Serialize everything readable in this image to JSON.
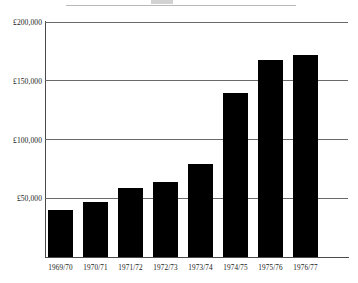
{
  "chart_data": {
    "type": "bar",
    "title": "",
    "xlabel": "",
    "ylabel": "",
    "categories": [
      "1969/70",
      "1970/71",
      "1971/72",
      "1972/73",
      "1973/74",
      "1974/75",
      "1975/76",
      "1976/77"
    ],
    "values": [
      40000,
      47000,
      59000,
      64000,
      79000,
      140000,
      168000,
      172000
    ],
    "ylim": [
      0,
      200000
    ],
    "yticks": [
      50000,
      100000,
      150000,
      200000
    ],
    "ytick_labels": [
      "£50,000",
      "£100,000",
      "£150,000",
      "£200,000"
    ],
    "grid": true,
    "legend": null,
    "bar_color": "#000000",
    "currency": "£"
  },
  "axes": {
    "y": {
      "ticks": [
        {
          "label": "£200,000",
          "value": 200000
        },
        {
          "label": "£150,000",
          "value": 150000
        },
        {
          "label": "£100,000",
          "value": 100000
        },
        {
          "label": "£50,000",
          "value": 50000
        }
      ]
    },
    "x": {
      "ticks": [
        {
          "label": "1969/70"
        },
        {
          "label": "1970/71"
        },
        {
          "label": "1971/72"
        },
        {
          "label": "1972/73"
        },
        {
          "label": "1973/74"
        },
        {
          "label": "1974/75"
        },
        {
          "label": "1975/76"
        },
        {
          "label": "1976/77"
        }
      ]
    }
  },
  "bars": [
    {
      "category": "1969/70",
      "value": 40000
    },
    {
      "category": "1970/71",
      "value": 47000
    },
    {
      "category": "1971/72",
      "value": 59000
    },
    {
      "category": "1972/73",
      "value": 64000
    },
    {
      "category": "1973/74",
      "value": 79000
    },
    {
      "category": "1974/75",
      "value": 140000
    },
    {
      "category": "1975/76",
      "value": 168000
    },
    {
      "category": "1976/77",
      "value": 172000
    }
  ],
  "colors": {
    "bar": "#000000",
    "gridline": "#6a6a6a",
    "axis": "#4a4a4a",
    "text": "#1a1a1a",
    "background": "#ffffff"
  }
}
